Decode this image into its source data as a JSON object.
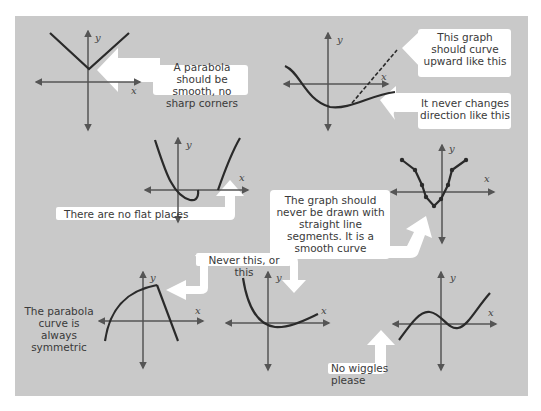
{
  "diagram": {
    "background_color": "#c9c9c9",
    "callout_color": "#ffffff",
    "line_color": "#2a2a2a",
    "axis_color": "#555555",
    "axis_labels": {
      "x": "x",
      "y": "y"
    },
    "callouts": {
      "sharp_corners": "A parabola should be smooth, no sharp corners",
      "curve_upward": "This graph should curve upward like this",
      "never_changes": "It never changes direction like this",
      "no_flat": "There are no flat places",
      "straight_segments": "The graph should never be drawn with straight line segments. It is a smooth curve",
      "never_this": "Never this, or this",
      "symmetric": "The parabola curve is always symmetric",
      "no_wiggles": "No wiggles please"
    },
    "graphs": [
      {
        "id": "v-shape",
        "mistake": "sharp corner"
      },
      {
        "id": "flattening",
        "mistake": "changes direction"
      },
      {
        "id": "flat-spot",
        "mistake": "flat place"
      },
      {
        "id": "segments",
        "mistake": "straight line segments"
      },
      {
        "id": "asymmetric-peak",
        "mistake": "not symmetric"
      },
      {
        "id": "asymmetric-decay",
        "mistake": "not symmetric"
      },
      {
        "id": "wiggle",
        "mistake": "wiggles"
      }
    ]
  }
}
